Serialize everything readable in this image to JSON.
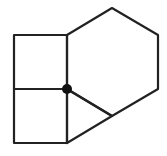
{
  "diagram": {
    "colors": {
      "stroke": "#222222",
      "vertex": "#111111",
      "background": "#ffffff"
    },
    "points": {
      "TL": [
        14,
        35
      ],
      "TR": [
        67,
        35
      ],
      "ML": [
        14,
        89
      ],
      "O": [
        67,
        89
      ],
      "BL": [
        14,
        143
      ],
      "BR": [
        67,
        143
      ],
      "H_top": [
        112,
        8
      ],
      "H_ur": [
        158,
        35
      ],
      "H_lr": [
        158,
        89
      ],
      "H_bot": [
        112,
        116
      ]
    },
    "shapes": [
      {
        "name": "upper-square",
        "type": "square",
        "vertices": [
          "TL",
          "TR",
          "O",
          "ML"
        ]
      },
      {
        "name": "lower-square",
        "type": "square",
        "vertices": [
          "ML",
          "O",
          "BR",
          "BL"
        ]
      },
      {
        "name": "hexagon",
        "type": "hexagon",
        "vertices": [
          "TR",
          "H_top",
          "H_ur",
          "H_lr",
          "H_bot",
          "O"
        ]
      },
      {
        "name": "triangle",
        "type": "triangle",
        "vertices": [
          "O",
          "H_bot",
          "BR"
        ]
      }
    ],
    "marked_vertex": {
      "point": "O",
      "radius": 5
    }
  }
}
